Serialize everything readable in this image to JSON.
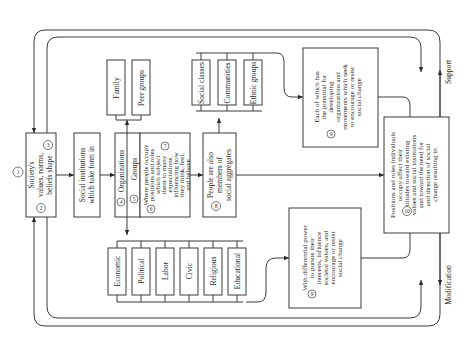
{
  "diagram": {
    "orientation": "rotated-90-ccw",
    "nodes": {
      "values": {
        "num_top": "1",
        "num_right": "3",
        "num_left": "2",
        "lines": [
          "Society's",
          "values, norms,",
          "beliefs shape"
        ]
      },
      "institutions": {
        "lines": [
          "Social institutions",
          "which take form in"
        ]
      },
      "org_groups": {
        "organizations": "Organizations",
        "organizations_num": "4",
        "groups": "Groups",
        "groups_num": "5",
        "where_num_a": "6",
        "where_num_b": "7",
        "where_lines": [
          "Where people occupy",
          "positions and roles",
          "which subject",
          "them to many",
          "expectations",
          "influencing how",
          "they think, feel,",
          "and behave"
        ]
      },
      "group_types": [
        "Family",
        "Peer groups"
      ],
      "institution_types": [
        "Economic",
        "Political",
        "Labor",
        "Civic",
        "Religious",
        "Educational"
      ],
      "aggregates_intro": {
        "num": "8",
        "lines": [
          "People are also",
          "members of",
          "social aggregates"
        ]
      },
      "aggregate_types": [
        "Social classes",
        "Communities",
        "Ethnic groups"
      ],
      "potential": {
        "num": "9",
        "lines": [
          "Each of which has",
          "the potential for",
          "developing",
          "organizations and",
          "movements which seek",
          "to encourage or resist",
          "social change"
        ]
      },
      "power": {
        "num": "9",
        "lines": [
          "With differential power",
          "to pursue their",
          "interests, influence",
          "societal values, and",
          "encourage or resist",
          "social change"
        ]
      },
      "positions": {
        "num": "10",
        "lines": [
          "Positions and roles individuals",
          "occupy affect their",
          "attitudes toward existing",
          "values and social institutions",
          "and toward the need for",
          "and direction of social",
          "change resulting in"
        ]
      }
    },
    "edge_labels": {
      "support": "Support",
      "modification": "Modification"
    },
    "colors": {
      "stroke": "#3a3a3a",
      "text": "#2a2a2a",
      "background": "#ffffff"
    }
  }
}
